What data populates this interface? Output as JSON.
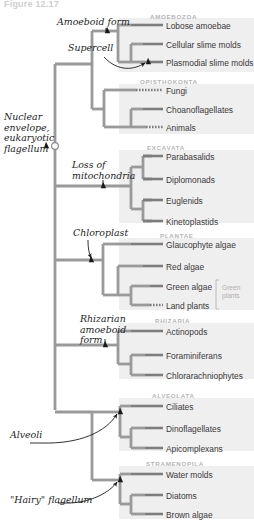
{
  "figure": {
    "title": "Figure 12.17"
  },
  "groups": [
    {
      "name": "AMOEBOZOA",
      "label": "AMOEBOZOA",
      "x": 150,
      "y": 13,
      "box": {
        "x": 119,
        "y": 18,
        "w": 135,
        "h": 54
      }
    },
    {
      "name": "OPISTHOKONTA",
      "label": "OPISTHOKONTA",
      "x": 140,
      "y": 78,
      "box": {
        "x": 119,
        "y": 84,
        "w": 135,
        "h": 50
      }
    },
    {
      "name": "EXCAVATA",
      "label": "EXCAVATA",
      "x": 147,
      "y": 144,
      "box": {
        "x": 119,
        "y": 150,
        "w": 135,
        "h": 73
      }
    },
    {
      "name": "PLANTAE",
      "label": "PLANTAE",
      "x": 160,
      "y": 232,
      "box": {
        "x": 119,
        "y": 238,
        "w": 135,
        "h": 72
      }
    },
    {
      "name": "RHIZARIA",
      "label": "RHIZARIA",
      "x": 155,
      "y": 317,
      "box": {
        "x": 119,
        "y": 323,
        "w": 135,
        "h": 56
      }
    },
    {
      "name": "ALVEOLATA",
      "label": "ALVEOLATA",
      "x": 152,
      "y": 392,
      "box": {
        "x": 119,
        "y": 398,
        "w": 135,
        "h": 53
      }
    },
    {
      "name": "STRAMENOPILA",
      "label": "STRAMENOPILA",
      "x": 146,
      "y": 460,
      "box": {
        "x": 119,
        "y": 466,
        "w": 135,
        "h": 53
      }
    }
  ],
  "taxa": [
    {
      "name": "lobose-amoebae",
      "label": "Lobose amoebae",
      "x": 166,
      "y": 22,
      "tipY": 25,
      "tipX1": 131,
      "tipX2": 163,
      "dashed": false
    },
    {
      "name": "cellular-slime-molds",
      "label": "Cellular slime molds",
      "x": 166,
      "y": 41,
      "tipY": 44,
      "tipX1": 143,
      "tipX2": 163,
      "dashed": false
    },
    {
      "name": "plasmodial-slime-molds",
      "label": "Plasmodial slime molds",
      "x": 166,
      "y": 59,
      "tipY": 62,
      "tipX1": 148,
      "tipX2": 163,
      "dashed": false
    },
    {
      "name": "fungi",
      "label": "Fungi",
      "x": 166,
      "y": 87,
      "tipY": 90,
      "tipX1": 136,
      "tipX2": 163,
      "dashed": true
    },
    {
      "name": "choanoflagellates",
      "label": "Choanoflagellates",
      "x": 166,
      "y": 106,
      "tipY": 109,
      "tipX1": 143,
      "tipX2": 163,
      "dashed": false
    },
    {
      "name": "animals",
      "label": "Animals",
      "x": 166,
      "y": 124,
      "tipY": 127,
      "tipX1": 146,
      "tipX2": 163,
      "dashed": true
    },
    {
      "name": "parabasalids",
      "label": "Parabasalids",
      "x": 166,
      "y": 153,
      "tipY": 156,
      "tipX1": 143,
      "tipX2": 163,
      "dashed": false
    },
    {
      "name": "diplomonads",
      "label": "Diplomonads",
      "x": 166,
      "y": 176,
      "tipY": 179,
      "tipX1": 143,
      "tipX2": 163,
      "dashed": false
    },
    {
      "name": "euglenids",
      "label": "Euglenids",
      "x": 166,
      "y": 197,
      "tipY": 200,
      "tipX1": 143,
      "tipX2": 163,
      "dashed": false
    },
    {
      "name": "kinetoplastids",
      "label": "Kinetoplastids",
      "x": 166,
      "y": 218,
      "tipY": 221,
      "tipX1": 143,
      "tipX2": 163,
      "dashed": false
    },
    {
      "name": "glaucophyte-algae",
      "label": "Glaucophyte algae",
      "x": 166,
      "y": 241,
      "tipY": 244,
      "tipX1": 131,
      "tipX2": 163,
      "dashed": false
    },
    {
      "name": "red-algae",
      "label": "Red algae",
      "x": 166,
      "y": 263,
      "tipY": 266,
      "tipX1": 143,
      "tipX2": 163,
      "dashed": false
    },
    {
      "name": "green-algae",
      "label": "Green algae",
      "x": 166,
      "y": 283,
      "tipY": 286,
      "tipX1": 150,
      "tipX2": 163,
      "dashed": false
    },
    {
      "name": "land-plants",
      "label": "Land plants",
      "x": 166,
      "y": 302,
      "tipY": 305,
      "tipX1": 150,
      "tipX2": 163,
      "dashed": true
    },
    {
      "name": "actinopods",
      "label": "Actinopods",
      "x": 166,
      "y": 328,
      "tipY": 331,
      "tipX1": 131,
      "tipX2": 163,
      "dashed": false
    },
    {
      "name": "foraminiferans",
      "label": "Foraminiferans",
      "x": 166,
      "y": 352,
      "tipY": 355,
      "tipX1": 145,
      "tipX2": 163,
      "dashed": false
    },
    {
      "name": "chlorarachniophytes",
      "label": "Chlorarachniophytes",
      "x": 166,
      "y": 372,
      "tipY": 375,
      "tipX1": 145,
      "tipX2": 163,
      "dashed": false
    },
    {
      "name": "ciliates",
      "label": "Ciliates",
      "x": 166,
      "y": 403,
      "tipY": 406,
      "tipX1": 131,
      "tipX2": 163,
      "dashed": false
    },
    {
      "name": "dinoflagellates",
      "label": "Dinoflagellates",
      "x": 166,
      "y": 425,
      "tipY": 428,
      "tipX1": 145,
      "tipX2": 163,
      "dashed": false
    },
    {
      "name": "apicomplexans",
      "label": "Apicomplexans",
      "x": 166,
      "y": 445,
      "tipY": 448,
      "tipX1": 145,
      "tipX2": 163,
      "dashed": false
    },
    {
      "name": "water-molds",
      "label": "Water molds",
      "x": 166,
      "y": 471,
      "tipY": 474,
      "tipX1": 131,
      "tipX2": 163,
      "dashed": false
    },
    {
      "name": "diatoms",
      "label": "Diatoms",
      "x": 166,
      "y": 492,
      "tipY": 495,
      "tipX1": 145,
      "tipX2": 163,
      "dashed": false
    },
    {
      "name": "brown-algae",
      "label": "Brown algae",
      "x": 166,
      "y": 511,
      "tipY": 514,
      "tipX1": 145,
      "tipX2": 163,
      "dashed": false
    }
  ],
  "annotations": [
    {
      "name": "amoeboid-form",
      "label": "Amoeboid form",
      "x": 57,
      "y": 17,
      "arrow": false
    },
    {
      "name": "supercell",
      "label": "Supercell",
      "x": 68,
      "y": 43,
      "arrow": true
    },
    {
      "name": "nuclear-envelope",
      "label": "Nuclear\nenvelope,\neukaryotic\nflagellum",
      "x": 4,
      "y": 112,
      "arrow": false
    },
    {
      "name": "loss-of-mitochondria",
      "label": "Loss of\nmitochondria",
      "x": 72,
      "y": 160,
      "arrow": false
    },
    {
      "name": "chloroplast",
      "label": "Chloroplast",
      "x": 73,
      "y": 228,
      "arrow": true
    },
    {
      "name": "rhizarian-amoeboid-form",
      "label": "Rhizarian\namoeboid\nform",
      "x": 80,
      "y": 314,
      "arrow": false
    },
    {
      "name": "alveoli",
      "label": "Alveoli",
      "x": 10,
      "y": 430,
      "arrow": true
    },
    {
      "name": "hairy-flagellum",
      "label": "\"Hairy\" flagellum",
      "x": 10,
      "y": 495,
      "arrow": true
    }
  ],
  "brackets": [
    {
      "name": "green-plants",
      "label": "Green\nplants",
      "x": 222,
      "y": 284,
      "topY": 280,
      "botY": 309,
      "lineX": 216
    }
  ],
  "colors": {
    "branch": "#9a9a9a",
    "branch_dark": "#7d7d7d",
    "group_box": "#efefef",
    "group_label": "#b6b6b6",
    "taxon_text": "#3a3a3a",
    "annotation_text": "#1d1d1d",
    "arrow": "#1a1a1a",
    "marker_fill": "#1a1a1a",
    "background": "#ffffff"
  },
  "markers": {
    "root_circle": {
      "name": "root-origin-marker",
      "cx": 55,
      "cy": 146,
      "r": 3.4
    },
    "wedges": [
      {
        "name": "wedge-amoeboid-form",
        "x": 107,
        "y": 31
      },
      {
        "name": "wedge-supercell",
        "x": 148,
        "y": 62
      },
      {
        "name": "wedge-nuclear-envelope",
        "x": 46,
        "y": 146
      },
      {
        "name": "wedge-loss-mitochondria",
        "x": 103,
        "y": 186
      },
      {
        "name": "wedge-chloroplast",
        "x": 91,
        "y": 260
      },
      {
        "name": "wedge-rhizarian",
        "x": 105,
        "y": 345
      },
      {
        "name": "wedge-alveoli",
        "x": 120,
        "y": 412
      },
      {
        "name": "wedge-hairy-flagellum",
        "x": 120,
        "y": 480
      }
    ]
  }
}
